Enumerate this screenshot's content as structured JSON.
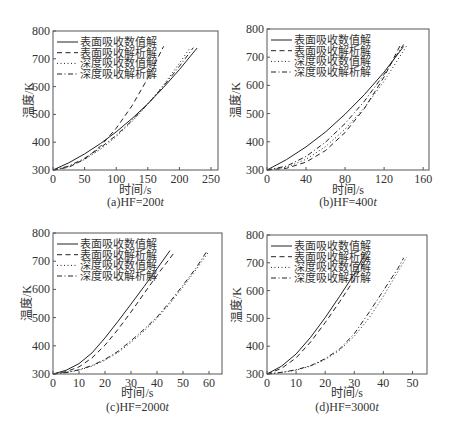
{
  "figure": {
    "y_axis_label": "温度/K",
    "x_axis_label": "时间/s"
  },
  "chart_data": [
    {
      "type": "line",
      "title": "(a)HF=200t",
      "caption_text": "(a)HF=200",
      "caption_var": "t",
      "xlabel": "时间/s",
      "ylabel": "温度/K",
      "xlim": [
        0,
        261
      ],
      "ylim": [
        300,
        800
      ],
      "xticks": [
        0,
        50,
        100,
        150,
        200,
        250
      ],
      "yticks": [
        300,
        400,
        500,
        600,
        700,
        800
      ],
      "grid": false,
      "legend_position": "upper left",
      "legend": [
        "表面吸收数值解",
        "表面吸收解析解",
        "深度吸收数值解",
        "深度吸收解析解"
      ],
      "series": [
        {
          "name": "表面吸收数值解",
          "style": "solid",
          "points": [
            [
              0,
              300
            ],
            [
              25,
              326
            ],
            [
              50,
              358
            ],
            [
              75,
              395
            ],
            [
              100,
              437
            ],
            [
              125,
              485
            ],
            [
              150,
              538
            ],
            [
              175,
              597
            ],
            [
              200,
              661
            ],
            [
              228,
              739
            ]
          ]
        },
        {
          "name": "表面吸收解析解",
          "style": "dashed",
          "points": [
            [
              0,
              300
            ],
            [
              25,
              310
            ],
            [
              50,
              339
            ],
            [
              75,
              385
            ],
            [
              100,
              450
            ],
            [
              125,
              531
            ],
            [
              150,
              630
            ],
            [
              175,
              745
            ]
          ]
        },
        {
          "name": "深度吸收数值解",
          "style": "dotted",
          "points": [
            [
              0,
              300
            ],
            [
              25,
              312
            ],
            [
              50,
              338
            ],
            [
              75,
              374
            ],
            [
              100,
              420
            ],
            [
              125,
              474
            ],
            [
              150,
              537
            ],
            [
              175,
              606
            ],
            [
              200,
              684
            ],
            [
              217,
              740
            ]
          ]
        },
        {
          "name": "深度吸收解析解",
          "style": "dashdot",
          "points": [
            [
              0,
              300
            ],
            [
              25,
              314
            ],
            [
              50,
              342
            ],
            [
              75,
              380
            ],
            [
              100,
              425
            ],
            [
              125,
              478
            ],
            [
              150,
              537
            ],
            [
              175,
              602
            ],
            [
              200,
              673
            ],
            [
              222,
              740
            ]
          ]
        }
      ]
    },
    {
      "type": "line",
      "title": "(b)HF=400t",
      "caption_text": "(b)HF=400",
      "caption_var": "t",
      "xlabel": "时间/s",
      "ylabel": "温度/K",
      "xlim": [
        0,
        166
      ],
      "ylim": [
        300,
        800
      ],
      "xticks": [
        0,
        40,
        80,
        120,
        160
      ],
      "yticks": [
        300,
        400,
        500,
        600,
        700,
        800
      ],
      "grid": false,
      "legend_position": "upper left",
      "legend": [
        "表面吸收数值解",
        "表面吸收解析解",
        "深度吸收数值解",
        "深度吸收解析解"
      ],
      "series": [
        {
          "name": "表面吸收数值解",
          "style": "solid",
          "points": [
            [
              0,
              300
            ],
            [
              20,
              337
            ],
            [
              40,
              382
            ],
            [
              60,
              435
            ],
            [
              80,
              498
            ],
            [
              100,
              568
            ],
            [
              120,
              647
            ],
            [
              140,
              738
            ]
          ]
        },
        {
          "name": "表面吸收解析解",
          "style": "dashed",
          "points": [
            [
              0,
              300
            ],
            [
              20,
              306
            ],
            [
              40,
              328
            ],
            [
              60,
              369
            ],
            [
              80,
              433
            ],
            [
              100,
              519
            ],
            [
              120,
              630
            ],
            [
              137,
              745
            ]
          ]
        },
        {
          "name": "深度吸收数值解",
          "style": "dotted",
          "points": [
            [
              0,
              300
            ],
            [
              20,
              310
            ],
            [
              40,
              338
            ],
            [
              60,
              383
            ],
            [
              80,
              445
            ],
            [
              100,
              522
            ],
            [
              120,
              615
            ],
            [
              143,
              740
            ]
          ]
        },
        {
          "name": "深度吸收解析解",
          "style": "dashdot",
          "points": [
            [
              0,
              300
            ],
            [
              20,
              314
            ],
            [
              40,
              348
            ],
            [
              60,
              399
            ],
            [
              80,
              465
            ],
            [
              100,
              545
            ],
            [
              120,
              639
            ],
            [
              140,
              745
            ]
          ]
        }
      ]
    },
    {
      "type": "line",
      "title": "(c)HF=2000t",
      "caption_text": "(c)HF=2000",
      "caption_var": "t",
      "xlabel": "时间/s",
      "ylabel": "温度/K",
      "xlim": [
        0,
        65
      ],
      "ylim": [
        300,
        800
      ],
      "xticks": [
        0,
        10,
        20,
        30,
        40,
        50,
        60
      ],
      "yticks": [
        300,
        400,
        500,
        600,
        700,
        800
      ],
      "grid": false,
      "legend_position": "upper left",
      "legend": [
        "表面吸收数值解",
        "表面吸收解析解",
        "深度吸收数值解",
        "深度吸收解析解"
      ],
      "series": [
        {
          "name": "表面吸收数值解",
          "style": "solid",
          "points": [
            [
              0,
              300
            ],
            [
              5,
              313
            ],
            [
              10,
              337
            ],
            [
              15,
              375
            ],
            [
              20,
              428
            ],
            [
              25,
              487
            ],
            [
              30,
              548
            ],
            [
              35,
              610
            ],
            [
              40,
              673
            ],
            [
              45,
              738
            ]
          ]
        },
        {
          "name": "表面吸收解析解",
          "style": "dashed",
          "points": [
            [
              0,
              300
            ],
            [
              5,
              308
            ],
            [
              10,
              325
            ],
            [
              15,
              357
            ],
            [
              20,
              402
            ],
            [
              25,
              458
            ],
            [
              30,
              520
            ],
            [
              35,
              585
            ],
            [
              40,
              650
            ],
            [
              47,
              735
            ]
          ]
        },
        {
          "name": "深度吸收数值解",
          "style": "dotted",
          "points": [
            [
              0,
              300
            ],
            [
              5,
              305
            ],
            [
              10,
              314
            ],
            [
              15,
              328
            ],
            [
              20,
              349
            ],
            [
              25,
              376
            ],
            [
              30,
              412
            ],
            [
              35,
              452
            ],
            [
              40,
              497
            ],
            [
              45,
              550
            ],
            [
              50,
              608
            ],
            [
              55,
              670
            ],
            [
              60,
              735
            ]
          ]
        },
        {
          "name": "深度吸收解析解",
          "style": "dashdot",
          "points": [
            [
              0,
              300
            ],
            [
              5,
              305
            ],
            [
              10,
              315
            ],
            [
              15,
              330
            ],
            [
              20,
              352
            ],
            [
              25,
              380
            ],
            [
              30,
              418
            ],
            [
              35,
              458
            ],
            [
              40,
              502
            ],
            [
              45,
              556
            ],
            [
              50,
              615
            ],
            [
              55,
              676
            ],
            [
              59,
              733
            ]
          ]
        }
      ]
    },
    {
      "type": "line",
      "title": "(d)HF=3000t",
      "caption_text": "(d)HF=3000",
      "caption_var": "t",
      "xlabel": "时间/s",
      "ylabel": "温度/K",
      "xlim": [
        0,
        55
      ],
      "ylim": [
        300,
        800
      ],
      "xticks": [
        0,
        10,
        20,
        30,
        40,
        50
      ],
      "yticks": [
        300,
        400,
        500,
        600,
        700,
        800
      ],
      "grid": false,
      "legend_position": "upper left",
      "legend": [
        "表面吸收数值解",
        "表面吸收解析解",
        "深度吸收数值解",
        "深度吸收解析解"
      ],
      "series": [
        {
          "name": "表面吸收数值解",
          "style": "solid",
          "points": [
            [
              0,
              300
            ],
            [
              5,
              328
            ],
            [
              10,
              372
            ],
            [
              15,
              432
            ],
            [
              20,
              503
            ],
            [
              25,
              580
            ],
            [
              30,
              660
            ],
            [
              34,
              738
            ]
          ]
        },
        {
          "name": "表面吸收解析解",
          "style": "dashed",
          "points": [
            [
              0,
              300
            ],
            [
              5,
              320
            ],
            [
              10,
              358
            ],
            [
              15,
              415
            ],
            [
              20,
              485
            ],
            [
              25,
              560
            ],
            [
              30,
              640
            ],
            [
              35,
              728
            ]
          ]
        },
        {
          "name": "深度吸收数值解",
          "style": "dotted",
          "points": [
            [
              0,
              300
            ],
            [
              5,
              305
            ],
            [
              10,
              314
            ],
            [
              15,
              328
            ],
            [
              20,
              352
            ],
            [
              25,
              386
            ],
            [
              30,
              436
            ],
            [
              35,
              500
            ],
            [
              40,
              580
            ],
            [
              45,
              668
            ],
            [
              48,
              720
            ]
          ]
        },
        {
          "name": "深度吸收解析解",
          "style": "dashdot",
          "points": [
            [
              0,
              300
            ],
            [
              5,
              306
            ],
            [
              10,
              315
            ],
            [
              15,
              330
            ],
            [
              20,
              355
            ],
            [
              25,
              390
            ],
            [
              30,
              445
            ],
            [
              35,
              520
            ],
            [
              40,
              600
            ],
            [
              45,
              680
            ],
            [
              47,
              718
            ]
          ]
        }
      ]
    }
  ]
}
